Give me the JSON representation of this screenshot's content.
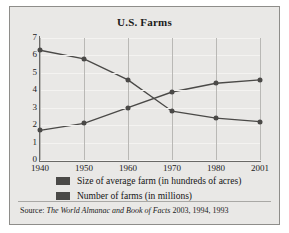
{
  "chart_data": {
    "type": "line",
    "title": "U.S. Farms",
    "xlabel": "",
    "ylabel": "",
    "categories": [
      "1940",
      "1950",
      "1960",
      "1970",
      "1980",
      "2001"
    ],
    "x": [
      1940,
      1950,
      1960,
      1970,
      1980,
      2001
    ],
    "ylim": [
      0,
      7
    ],
    "yticks": [
      "0",
      "1",
      "2",
      "3",
      "4",
      "5",
      "6",
      "7"
    ],
    "grid": "horizontal-and-vertical",
    "legend_position": "below-plot",
    "series": [
      {
        "name": "Size of average farm (in hundreds of acres)",
        "values": [
          1.7,
          2.1,
          3.0,
          3.9,
          4.4,
          4.6
        ],
        "color": "#4a4947",
        "marker": "circle"
      },
      {
        "name": "Number of farms (in millions)",
        "values": [
          6.3,
          5.8,
          4.6,
          2.8,
          2.4,
          2.2
        ],
        "color": "#4a4947",
        "marker": "circle"
      }
    ]
  },
  "figure": {
    "title": "U.S. Farms"
  },
  "legend": {
    "items": [
      {
        "label": "Size of average farm (in hundreds of acres)"
      },
      {
        "label": "Number of farms (in millions)"
      }
    ]
  },
  "source": {
    "label": "Source:",
    "publication": "The World Almanac and Book of Facts",
    "years": "2003, 1994, 1993"
  }
}
